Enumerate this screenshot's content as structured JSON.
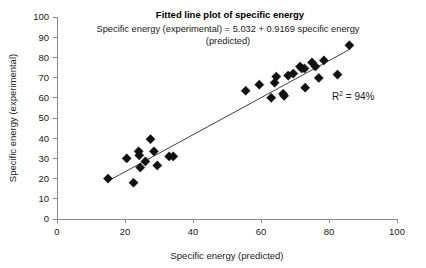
{
  "chart_data": {
    "type": "scatter",
    "title": "Fitted line plot of specific energy",
    "subtitle_line1": "Specific energy (experimental) = 5.032 + 0.9169 specific energy",
    "subtitle_line2": "(predicted)",
    "xlabel": "Specific energy (predicted)",
    "ylabel": "Specific energy (experimental)",
    "xlim": [
      0,
      100
    ],
    "ylim": [
      0,
      100
    ],
    "xticks": [
      0,
      20,
      40,
      60,
      80,
      100
    ],
    "yticks": [
      0,
      10,
      20,
      30,
      40,
      50,
      60,
      70,
      80,
      90,
      100
    ],
    "grid": false,
    "legend": "none",
    "annotation": {
      "r_squared_label": "R",
      "r_squared_exponent": "2",
      "r_squared_value": "= 94%",
      "full_text": "R2 = 94%",
      "x": 78,
      "y": 63
    },
    "fit_line": {
      "intercept": 5.032,
      "slope": 0.9169,
      "x_start": 15,
      "x_end": 86,
      "color": "#3f3f3f"
    },
    "marker": {
      "shape": "diamond",
      "color": "#111111",
      "size": 4.6
    },
    "points": [
      {
        "x": 15.0,
        "y": 20.0
      },
      {
        "x": 20.5,
        "y": 30.0
      },
      {
        "x": 22.5,
        "y": 18.0
      },
      {
        "x": 24.0,
        "y": 33.5
      },
      {
        "x": 24.2,
        "y": 31.5
      },
      {
        "x": 24.5,
        "y": 25.5
      },
      {
        "x": 26.0,
        "y": 28.5
      },
      {
        "x": 27.5,
        "y": 39.5
      },
      {
        "x": 28.5,
        "y": 33.5
      },
      {
        "x": 29.5,
        "y": 26.5
      },
      {
        "x": 33.0,
        "y": 31.0
      },
      {
        "x": 34.2,
        "y": 31.0
      },
      {
        "x": 55.5,
        "y": 63.5
      },
      {
        "x": 59.5,
        "y": 66.5
      },
      {
        "x": 63.0,
        "y": 60.0
      },
      {
        "x": 64.0,
        "y": 67.5
      },
      {
        "x": 64.5,
        "y": 70.5
      },
      {
        "x": 66.5,
        "y": 62.0
      },
      {
        "x": 66.8,
        "y": 61.0
      },
      {
        "x": 68.0,
        "y": 71.0
      },
      {
        "x": 69.5,
        "y": 72.0
      },
      {
        "x": 71.5,
        "y": 75.5
      },
      {
        "x": 72.0,
        "y": 74.5
      },
      {
        "x": 72.8,
        "y": 74.5
      },
      {
        "x": 73.0,
        "y": 65.0
      },
      {
        "x": 75.0,
        "y": 77.5
      },
      {
        "x": 76.0,
        "y": 75.5
      },
      {
        "x": 77.0,
        "y": 69.8
      },
      {
        "x": 78.5,
        "y": 78.5
      },
      {
        "x": 82.5,
        "y": 71.5
      },
      {
        "x": 86.0,
        "y": 86.0
      }
    ]
  }
}
